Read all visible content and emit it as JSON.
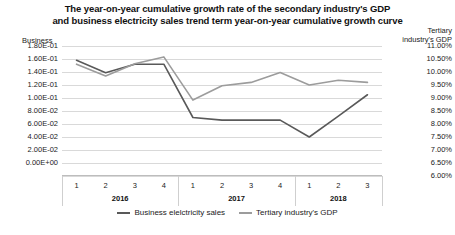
{
  "title": {
    "line1": "The year-on-year cumulative growth rate of the secondary industry's GDP",
    "line2": "and business electricity sales trend term year-on-year cumulative growth curve"
  },
  "axes": {
    "left_caption": "Business",
    "right_caption_line1": "Tertiary",
    "right_caption_line2": "industry's GDP",
    "left_ticks": [
      "1.80E-01",
      "1.60E-01",
      "1.40E-01",
      "1.20E-01",
      "1.00E-01",
      "8.00E-02",
      "6.00E-02",
      "4.00E-02",
      "2.00E-02",
      "0.00E+00"
    ],
    "right_ticks": [
      "11.00%",
      "10.50%",
      "10.00%",
      "9.50%",
      "9.00%",
      "8.50%",
      "8.00%",
      "7.50%",
      "7.00%",
      "6.50%",
      "6.00%"
    ],
    "quarter_labels": [
      "1",
      "2",
      "3",
      "4",
      "1",
      "2",
      "3",
      "4",
      "1",
      "2",
      "3"
    ],
    "year_groups": [
      "2016",
      "2017",
      "2018"
    ]
  },
  "legend": {
    "items": [
      {
        "label": "Business elelctricity sales",
        "color": "#595959"
      },
      {
        "label": "Tertiary industry's GDP",
        "color": "#9c9c9c"
      }
    ]
  },
  "chart_data": {
    "type": "line",
    "title": "The year-on-year cumulative growth rate of the secondary industry's GDP and business electricity sales trend term year-on-year cumulative growth curve",
    "xlabel": "",
    "ylabel": "Business",
    "y2label": "Tertiary industry's GDP",
    "grid": true,
    "legend_position": "bottom",
    "x": [
      "2016 Q1",
      "2016 Q2",
      "2016 Q3",
      "2016 Q4",
      "2017 Q1",
      "2017 Q2",
      "2017 Q3",
      "2017 Q4",
      "2018 Q1",
      "2018 Q2",
      "2018 Q3"
    ],
    "categories": [
      "1",
      "2",
      "3",
      "4",
      "1",
      "2",
      "3",
      "4",
      "1",
      "2",
      "3"
    ],
    "year_groups": [
      "2016",
      "2016",
      "2016",
      "2016",
      "2017",
      "2017",
      "2017",
      "2017",
      "2018",
      "2018",
      "2018"
    ],
    "ylim": [
      0.0,
      0.18
    ],
    "ytick_values": [
      0.18,
      0.16,
      0.14,
      0.12,
      0.1,
      0.08,
      0.06,
      0.04,
      0.02,
      0.0
    ],
    "y2lim": [
      0.06,
      0.11
    ],
    "y2tick_values": [
      0.11,
      0.105,
      0.1,
      0.095,
      0.09,
      0.085,
      0.08,
      0.075,
      0.07,
      0.065,
      0.06
    ],
    "series": [
      {
        "name": "Business elelctricity sales",
        "axis": "left",
        "color": "#595959",
        "values": [
          0.158,
          0.139,
          0.152,
          0.152,
          0.07,
          0.066,
          0.066,
          0.066,
          0.04,
          0.072,
          0.105
        ]
      },
      {
        "name": "Tertiary industry's GDP",
        "axis": "right",
        "color": "#9c9c9c",
        "values": [
          0.103,
          0.0985,
          0.1032,
          0.1058,
          0.0892,
          0.0947,
          0.096,
          0.0998,
          0.095,
          0.0968,
          0.096
        ]
      }
    ]
  }
}
